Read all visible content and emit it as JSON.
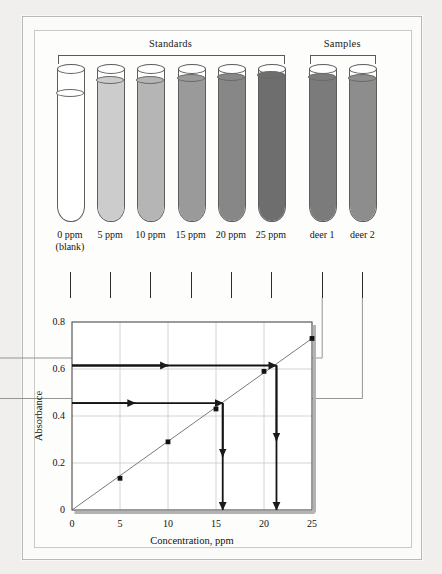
{
  "figure": {
    "group_labels": [
      {
        "name": "standards",
        "text": "Standards"
      },
      {
        "name": "samples",
        "text": "Samples"
      }
    ]
  },
  "tubes": [
    {
      "id": "tube-0ppm",
      "label": "0 ppm\n(blank)",
      "group": "standards",
      "fill": "#ffffff",
      "fill_level": 0.0
    },
    {
      "id": "tube-5ppm",
      "label": "5 ppm",
      "group": "standards",
      "fill": "#cccccc",
      "fill_level": 0.93
    },
    {
      "id": "tube-10ppm",
      "label": "10 ppm",
      "group": "standards",
      "fill": "#b5b5b5",
      "fill_level": 0.93
    },
    {
      "id": "tube-15ppm",
      "label": "15 ppm",
      "group": "standards",
      "fill": "#9a9a9a",
      "fill_level": 0.94
    },
    {
      "id": "tube-20ppm",
      "label": "20 ppm",
      "group": "standards",
      "fill": "#878787",
      "fill_level": 0.95
    },
    {
      "id": "tube-25ppm",
      "label": "25 ppm",
      "group": "standards",
      "fill": "#6e6e6e",
      "fill_level": 0.96
    },
    {
      "id": "tube-deer1",
      "label": "deer 1",
      "group": "samples",
      "fill": "#7b7b7b",
      "fill_level": 0.95
    },
    {
      "id": "tube-deer2",
      "label": "deer 2",
      "group": "samples",
      "fill": "#8d8d8d",
      "fill_level": 0.94
    }
  ],
  "chart_data": {
    "type": "scatter",
    "title": "",
    "xlabel": "Concentration, ppm",
    "ylabel": "Absorbance",
    "xlim": [
      0,
      25
    ],
    "ylim": [
      0,
      0.8
    ],
    "xticks": [
      0,
      5,
      10,
      15,
      20,
      25
    ],
    "yticks": [
      0,
      0.2,
      0.4,
      0.6,
      0.8
    ],
    "xticklabels": [
      "0",
      "5",
      "10",
      "15",
      "20",
      "25"
    ],
    "yticklabels": [
      "0",
      "0.2",
      "0.4",
      "0.6",
      "0.8"
    ],
    "grid": true,
    "legend": "none",
    "series": [
      {
        "name": "Standard calibration points",
        "marker": "square",
        "x": [
          0,
          5,
          10,
          15,
          20,
          25
        ],
        "y": [
          0.0,
          0.135,
          0.29,
          0.43,
          0.59,
          0.73
        ]
      }
    ],
    "trendline": {
      "name": "best-fit line",
      "x": [
        0,
        25
      ],
      "y": [
        0.0,
        0.73
      ]
    },
    "readouts": [
      {
        "name": "deer-2-readout",
        "absorbance": 0.455,
        "concentration": 15.7
      },
      {
        "name": "deer-1-readout",
        "absorbance": 0.615,
        "concentration": 21.3
      }
    ]
  }
}
